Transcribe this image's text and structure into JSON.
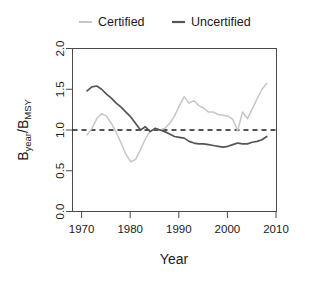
{
  "chart_data": {
    "type": "line",
    "title": "",
    "xlabel": "Year",
    "ylabel": "B_year/B_MSY",
    "ylabel_parts": {
      "num_base": "B",
      "num_sub": "year",
      "slash": "/",
      "den_base": "B",
      "den_sub": "MSY"
    },
    "xlim": [
      1968,
      2010
    ],
    "ylim": [
      0.0,
      2.0
    ],
    "xticks": [
      1970,
      1980,
      1990,
      2000,
      2010
    ],
    "xtick_labels": [
      "1970",
      "1980",
      "1990",
      "2000",
      "2010"
    ],
    "yticks": [
      0.0,
      0.5,
      1.0,
      1.5,
      2.0
    ],
    "ytick_labels": [
      "0.0",
      "0.5",
      "1.0",
      "1.5",
      "2.0"
    ],
    "grid": false,
    "legend_position": "top",
    "reference_lines": [
      {
        "name": "bmsy-reference",
        "orientation": "horizontal",
        "value": 1.0,
        "style": "dashed",
        "color": "#1a1a1a"
      }
    ],
    "series": [
      {
        "name": "Certified",
        "color": "#c6c6c6",
        "x": [
          1971,
          1972,
          1973,
          1974,
          1975,
          1976,
          1977,
          1978,
          1979,
          1980,
          1981,
          1982,
          1983,
          1984,
          1985,
          1986,
          1987,
          1988,
          1989,
          1990,
          1991,
          1992,
          1993,
          1994,
          1995,
          1996,
          1997,
          1998,
          1999,
          2000,
          2001,
          2002,
          2003,
          2004,
          2005,
          2006,
          2007,
          2008
        ],
        "values": [
          0.94,
          1.02,
          1.14,
          1.2,
          1.17,
          1.08,
          0.97,
          0.84,
          0.7,
          0.61,
          0.64,
          0.76,
          0.89,
          0.99,
          1.02,
          1.0,
          1.02,
          1.08,
          1.17,
          1.3,
          1.41,
          1.33,
          1.36,
          1.3,
          1.27,
          1.22,
          1.22,
          1.19,
          1.18,
          1.17,
          1.13,
          0.99,
          1.22,
          1.14,
          1.26,
          1.38,
          1.5,
          1.57
        ]
      },
      {
        "name": "Uncertified",
        "color": "#555555",
        "x": [
          1971,
          1972,
          1973,
          1974,
          1975,
          1976,
          1977,
          1978,
          1979,
          1980,
          1981,
          1982,
          1983,
          1984,
          1985,
          1986,
          1987,
          1988,
          1989,
          1990,
          1991,
          1992,
          1993,
          1994,
          1995,
          1996,
          1997,
          1998,
          1999,
          2000,
          2001,
          2002,
          2003,
          2004,
          2005,
          2006,
          2007,
          2008
        ],
        "values": [
          1.48,
          1.53,
          1.54,
          1.5,
          1.44,
          1.39,
          1.33,
          1.28,
          1.22,
          1.16,
          1.08,
          1.0,
          1.04,
          0.98,
          1.02,
          1.0,
          0.98,
          0.95,
          0.92,
          0.91,
          0.9,
          0.86,
          0.84,
          0.83,
          0.83,
          0.82,
          0.81,
          0.8,
          0.79,
          0.8,
          0.82,
          0.84,
          0.83,
          0.83,
          0.85,
          0.86,
          0.88,
          0.92
        ]
      }
    ]
  },
  "legend": {
    "items": [
      {
        "label": "Certified",
        "color": "#c6c6c6"
      },
      {
        "label": "Uncertified",
        "color": "#555555"
      }
    ]
  },
  "axes": {
    "x_title": "Year",
    "y_title_num_base": "B",
    "y_title_num_sub": "year",
    "y_title_slash": "/",
    "y_title_den_base": "B",
    "y_title_den_sub": "MSY"
  }
}
